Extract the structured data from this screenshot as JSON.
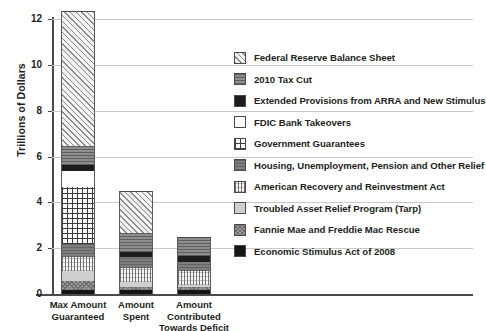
{
  "chart_data": {
    "type": "bar",
    "stacked": true,
    "title": "",
    "xlabel": "",
    "ylabel": "Trillions of Dollars",
    "ylim": [
      0,
      12
    ],
    "yticks": [
      0,
      2,
      4,
      6,
      8,
      10,
      12
    ],
    "ytick_labels": [
      "0",
      "2",
      "4",
      "6",
      "8",
      "10",
      "12"
    ],
    "grid": true,
    "grid_axis": "y",
    "legend_position": "right",
    "categories": [
      "Max Amount Guaranteed",
      "Amount Spent",
      "Amount Contributed Towards Deficit"
    ],
    "category_lines": [
      [
        "Max Amount",
        "Guaranteed"
      ],
      [
        "Amount",
        "Spent"
      ],
      [
        "Amount",
        "Contributed",
        "Towards Deficit"
      ]
    ],
    "series": [
      {
        "name": "Economic Stimulus Act of 2008",
        "pattern": "p-esa",
        "values": [
          0.17,
          0.17,
          0.17
        ]
      },
      {
        "name": "Fannie Mae and Freddie Mac Rescue",
        "pattern": "p-fnma",
        "values": [
          0.4,
          0.15,
          0.15
        ]
      },
      {
        "name": "Troubled Asset Relief Program (Tarp)",
        "pattern": "p-tarp",
        "values": [
          0.43,
          0.21,
          0.07
        ]
      },
      {
        "name": "American Recovery and Reinvestment Act",
        "pattern": "p-arra",
        "values": [
          0.62,
          0.62,
          0.62
        ]
      },
      {
        "name": "Housing, Unemployment, Pension and Other Relief",
        "pattern": "p-house",
        "values": [
          0.55,
          0.45,
          0.4
        ]
      },
      {
        "name": "Government Guarantees",
        "pattern": "p-gov",
        "values": [
          2.49,
          0.0,
          0.0
        ]
      },
      {
        "name": "FDIC Bank Takeovers",
        "pattern": "p-fdic",
        "values": [
          0.72,
          0.0,
          0.0
        ]
      },
      {
        "name": "Extended Provisions from ARRA and New Stimulus",
        "pattern": "p-ext",
        "values": [
          0.24,
          0.24,
          0.24
        ]
      },
      {
        "name": "2010 Tax Cut",
        "pattern": "p-tax",
        "values": [
          0.83,
          0.83,
          0.83
        ]
      },
      {
        "name": "Federal Reserve Balance Sheet",
        "pattern": "p-frbs",
        "values": [
          5.9,
          1.83,
          0.0
        ]
      }
    ],
    "totals": [
      12.35,
      4.5,
      2.48
    ]
  },
  "legend": {
    "items": [
      {
        "label": "Federal Reserve Balance Sheet",
        "pattern": "p-frbs"
      },
      {
        "label": "2010 Tax Cut",
        "pattern": "p-tax"
      },
      {
        "label": "Extended Provisions from ARRA and New Stimulus",
        "pattern": "p-ext"
      },
      {
        "label": "FDIC Bank Takeovers",
        "pattern": "p-fdic"
      },
      {
        "label": "Government Guarantees",
        "pattern": "p-gov"
      },
      {
        "label": "Housing, Unemployment, Pension and Other Relief",
        "pattern": "p-house"
      },
      {
        "label": "American Recovery and Reinvestment Act",
        "pattern": "p-arra"
      },
      {
        "label": "Troubled Asset Relief Program (Tarp)",
        "pattern": "p-tarp"
      },
      {
        "label": "Fannie Mae and Freddie Mac Rescue",
        "pattern": "p-fnma"
      },
      {
        "label": "Economic Stimulus Act of 2008",
        "pattern": "p-esa"
      }
    ]
  },
  "colors": {
    "axis": "#4a4a4a",
    "grid": "#c9c9c9",
    "text": "#231f20",
    "background": "#ffffff"
  }
}
